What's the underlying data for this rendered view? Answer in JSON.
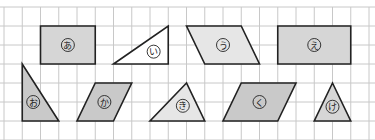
{
  "grid": {
    "origin_x": 4,
    "origin_y": 7,
    "cell_w": 18.25,
    "cell_h": 19,
    "cols": 20,
    "rows": 7,
    "line_color": "#c8c8c8",
    "border_color": "#bdbdbd"
  },
  "colors": {
    "stroke": "#222222",
    "fill_dark": "#c9c9c9",
    "fill_mid": "#d6d6d6",
    "fill_light": "#e6e6e6",
    "fill_white": "#ffffff"
  },
  "shapes": [
    {
      "id": "a",
      "label": "あ",
      "kind": "rectangle",
      "points": [
        [
          2,
          1
        ],
        [
          5,
          1
        ],
        [
          5,
          3
        ],
        [
          2,
          3
        ]
      ],
      "fill": "fill_mid",
      "label_pos": [
        3.5,
        2
      ]
    },
    {
      "id": "i",
      "label": "い",
      "kind": "right-triangle",
      "points": [
        [
          6,
          3
        ],
        [
          9,
          1
        ],
        [
          9,
          3
        ]
      ],
      "fill": "fill_white",
      "label_pos": [
        8.2,
        2.35
      ]
    },
    {
      "id": "u",
      "label": "う",
      "kind": "parallelogram",
      "points": [
        [
          10,
          1
        ],
        [
          13,
          1
        ],
        [
          14,
          3
        ],
        [
          11,
          3
        ]
      ],
      "fill": "fill_light",
      "label_pos": [
        12,
        2
      ]
    },
    {
      "id": "e",
      "label": "え",
      "kind": "rectangle",
      "points": [
        [
          15,
          1
        ],
        [
          19,
          1
        ],
        [
          19,
          3
        ],
        [
          15,
          3
        ]
      ],
      "fill": "fill_mid",
      "label_pos": [
        17,
        2
      ]
    },
    {
      "id": "o",
      "label": "お",
      "kind": "right-triangle",
      "points": [
        [
          1,
          3
        ],
        [
          1,
          6
        ],
        [
          3,
          6
        ]
      ],
      "fill": "fill_dark",
      "label_pos": [
        1.6,
        5
      ]
    },
    {
      "id": "ka",
      "label": "か",
      "kind": "parallelogram",
      "points": [
        [
          5,
          4
        ],
        [
          7,
          4
        ],
        [
          6,
          6
        ],
        [
          4,
          6
        ]
      ],
      "fill": "fill_dark",
      "label_pos": [
        5.5,
        5
      ]
    },
    {
      "id": "ki",
      "label": "き",
      "kind": "triangle",
      "points": [
        [
          10,
          4
        ],
        [
          8,
          6
        ],
        [
          11,
          6
        ]
      ],
      "fill": "fill_light",
      "label_pos": [
        9.8,
        5.2
      ]
    },
    {
      "id": "ku",
      "label": "く",
      "kind": "parallelogram",
      "points": [
        [
          13,
          4
        ],
        [
          16,
          4
        ],
        [
          15,
          6
        ],
        [
          12,
          6
        ]
      ],
      "fill": "fill_dark",
      "label_pos": [
        14,
        5
      ]
    },
    {
      "id": "ke",
      "label": "け",
      "kind": "isosceles-triangle",
      "points": [
        [
          18,
          4
        ],
        [
          17,
          6
        ],
        [
          19,
          6
        ]
      ],
      "fill": "fill_mid",
      "label_pos": [
        18,
        5.25
      ]
    }
  ]
}
